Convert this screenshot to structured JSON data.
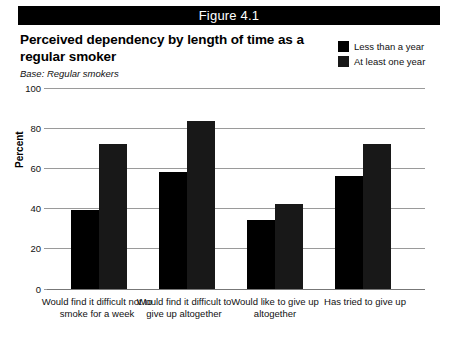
{
  "figure": {
    "banner_label": "Figure 4.1",
    "title": "Perceived dependency by length of time as a regular smoker",
    "base_note": "Base: Regular smokers"
  },
  "legend": {
    "items": [
      {
        "label": "Less than a year",
        "color": "#000000"
      },
      {
        "label": "At least one year",
        "color": "#181818"
      }
    ]
  },
  "axis": {
    "ylabel": "Percent",
    "yticks": [
      "0",
      "20",
      "40",
      "60",
      "80",
      "100"
    ]
  },
  "chart_data": {
    "type": "bar",
    "title": "Perceived dependency by length of time as a regular smoker",
    "subtitle": "Base: Regular smokers",
    "figure_label": "Figure 4.1",
    "categories": [
      "Would find it difficult not to smoke for a week",
      "Would find it difficult to give up altogether",
      "Would like to give up altogether",
      "Has tried to give up"
    ],
    "series": [
      {
        "name": "Less than a year",
        "color": "#000000",
        "values": [
          39,
          58,
          34,
          56
        ]
      },
      {
        "name": "At least one year",
        "color": "#181818",
        "values": [
          72,
          83,
          42,
          72
        ]
      }
    ],
    "xlabel": "",
    "ylabel": "Percent",
    "ylim": [
      0,
      100
    ],
    "yticks": [
      0,
      20,
      40,
      60,
      80,
      100
    ],
    "grid": true,
    "legend_position": "top-right"
  }
}
